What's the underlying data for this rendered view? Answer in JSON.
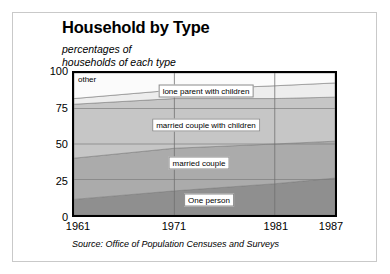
{
  "figure": {
    "title": "Household by Type",
    "subtitle": "percentages of\nhouseholds of each type",
    "source": "Source: Office of Population Censuses and Surveys"
  },
  "chart_data": {
    "type": "area",
    "stacked": true,
    "title": "Household by Type",
    "subtitle": "percentages of households of each type",
    "xlabel": "",
    "ylabel": "",
    "x": [
      1961,
      1971,
      1981,
      1987
    ],
    "tick_labels_x": [
      "1961",
      "1971",
      "1981",
      "1987"
    ],
    "tick_labels_y": [
      "0",
      "25",
      "50",
      "75",
      "100"
    ],
    "ticks_y": [
      0,
      25,
      50,
      75,
      100
    ],
    "xlim": [
      1961,
      1987
    ],
    "ylim": [
      0,
      100
    ],
    "grid": true,
    "legend": "inline-band-labels",
    "series": [
      {
        "name": "One person",
        "label": "One person",
        "color": "#8f8f8f",
        "values": [
          11,
          17,
          22,
          26
        ]
      },
      {
        "name": "married couple",
        "label": "married couple",
        "color": "#ababab",
        "values": [
          29,
          30,
          28,
          26
        ]
      },
      {
        "name": "married couple with children",
        "label": "married couple with children",
        "color": "#c6c6c6",
        "values": [
          38,
          35,
          32,
          31
        ]
      },
      {
        "name": "lone parent with children",
        "label": "lone parent with children",
        "color": "#ededed",
        "values": [
          4,
          6,
          9,
          10
        ]
      },
      {
        "name": "other",
        "label": "other",
        "color": "#fbfbfb",
        "values": [
          18,
          12,
          9,
          7
        ]
      }
    ],
    "cumulative_tops": {
      "One person": [
        11,
        17,
        22,
        26
      ],
      "married couple": [
        40,
        47,
        50,
        52
      ],
      "married couple with children": [
        78,
        82,
        82,
        83
      ],
      "lone parent with children": [
        82,
        88,
        91,
        93
      ],
      "other": [
        100,
        100,
        100,
        100
      ]
    }
  },
  "labels": {
    "other": "other",
    "lone_parent": "lone parent with children",
    "married_children": "married couple with children",
    "married": "married couple",
    "one_person": "One person"
  }
}
